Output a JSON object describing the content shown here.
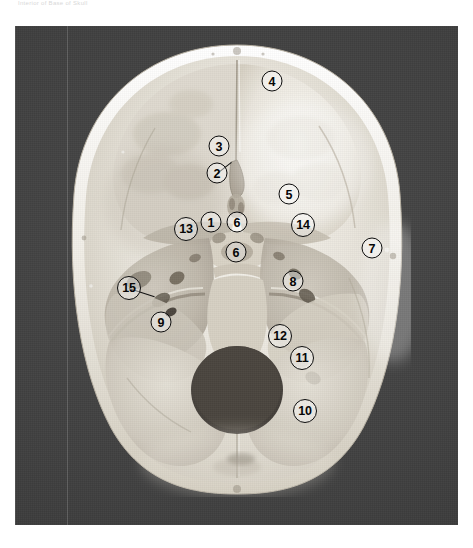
{
  "plate": {
    "caption": "Interior of Base of Skull",
    "alt_text": "superior view of the internal surface of the cranial base"
  },
  "figure": {
    "kind": "anatomical-photograph",
    "view": "superior view of interior cranial base",
    "background_color": "#414141",
    "marker_circle_color": "#0d0d0d",
    "marker_text_color": "#060606",
    "markers": [
      {
        "id": "marker-1",
        "label": "1",
        "x": 211,
        "y": 222,
        "size": "small",
        "leader": null
      },
      {
        "id": "marker-2",
        "label": "2",
        "x": 217,
        "y": 173,
        "size": "small",
        "leader": {
          "length": 18,
          "angle": -38
        }
      },
      {
        "id": "marker-3",
        "label": "3",
        "x": 219,
        "y": 146,
        "size": "small",
        "leader": null
      },
      {
        "id": "marker-4",
        "label": "4",
        "x": 272,
        "y": 81,
        "size": "small",
        "leader": null
      },
      {
        "id": "marker-5",
        "label": "5",
        "x": 289,
        "y": 194,
        "size": "small",
        "leader": null
      },
      {
        "id": "marker-6a",
        "label": "6",
        "x": 237,
        "y": 222,
        "size": "small",
        "leader": null
      },
      {
        "id": "marker-6b",
        "label": "6",
        "x": 236,
        "y": 252,
        "size": "small",
        "leader": null
      },
      {
        "id": "marker-7",
        "label": "7",
        "x": 372,
        "y": 248,
        "size": "small",
        "leader": null
      },
      {
        "id": "marker-8",
        "label": "8",
        "x": 293,
        "y": 281,
        "size": "small",
        "leader": null
      },
      {
        "id": "marker-9",
        "label": "9",
        "x": 161,
        "y": 322,
        "size": "small",
        "leader": null
      },
      {
        "id": "marker-10",
        "label": "10",
        "x": 305,
        "y": 411,
        "size": "large",
        "leader": null
      },
      {
        "id": "marker-11",
        "label": "11",
        "x": 302,
        "y": 358,
        "size": "large",
        "leader": null
      },
      {
        "id": "marker-12",
        "label": "12",
        "x": 280,
        "y": 336,
        "size": "large",
        "leader": null
      },
      {
        "id": "marker-13",
        "label": "13",
        "x": 186,
        "y": 229,
        "size": "large",
        "leader": null
      },
      {
        "id": "marker-14",
        "label": "14",
        "x": 303,
        "y": 225,
        "size": "large",
        "leader": null
      },
      {
        "id": "marker-15",
        "label": "15",
        "x": 129,
        "y": 288,
        "size": "large",
        "leader": {
          "length": 27,
          "angle": 18
        }
      }
    ]
  }
}
